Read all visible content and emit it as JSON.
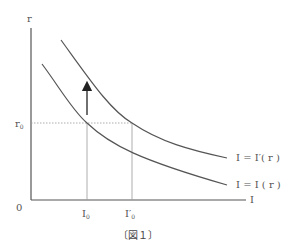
{
  "figure": {
    "caption": "〔図１〕",
    "axes": {
      "y_label": "r",
      "x_label": "I",
      "origin_label": "0"
    },
    "levels": {
      "r0_label": "r",
      "r0_sub": "0",
      "I0_label": "I",
      "I0_sub": "0",
      "I0p_label": "I′",
      "I0p_sub": "0"
    },
    "curves": [
      {
        "name": "shifted-investment-curve",
        "label": "I = I′( r )"
      },
      {
        "name": "original-investment-curve",
        "label": "I = I ( r )"
      }
    ],
    "arrow": {
      "direction": "up",
      "meaning": "shift of investment curve"
    },
    "colors": {
      "axis": "#555555",
      "curve": "#555555",
      "guide": "#999999",
      "text": "#555555"
    }
  }
}
